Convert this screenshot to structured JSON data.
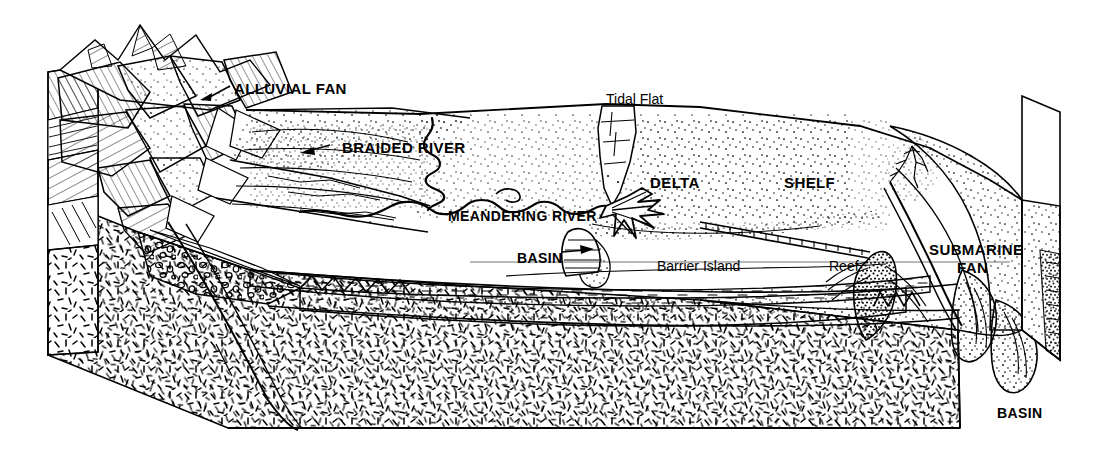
{
  "figure": {
    "type": "geological-block-diagram",
    "background_color": "#ffffff",
    "ink_color": "#000000",
    "width": 1102,
    "height": 452
  },
  "labels": [
    {
      "id": "alluvial-fan",
      "text": "ALLUVIAL FAN",
      "case": "upper",
      "x": 234,
      "y": 80,
      "size": 15,
      "arrow": true,
      "arrow_dir": "down-left"
    },
    {
      "id": "braided-river",
      "text": "BRAIDED RIVER",
      "case": "upper",
      "x": 332,
      "y": 139,
      "size": 15,
      "arrow": true,
      "arrow_dir": "left"
    },
    {
      "id": "tidal-flat",
      "text": "Tidal Flat",
      "case": "mixed",
      "x": 606,
      "y": 91,
      "size": 14,
      "arrow": false,
      "arrow_dir": ""
    },
    {
      "id": "meandering-river",
      "text": "MEANDERING RIVER",
      "case": "upper",
      "x": 448,
      "y": 208,
      "size": 14,
      "arrow": false,
      "arrow_dir": ""
    },
    {
      "id": "delta",
      "text": "DELTA",
      "case": "upper",
      "x": 650,
      "y": 174,
      "size": 15,
      "arrow": false,
      "arrow_dir": ""
    },
    {
      "id": "shelf",
      "text": "SHELF",
      "case": "upper",
      "x": 784,
      "y": 174,
      "size": 15,
      "arrow": false,
      "arrow_dir": ""
    },
    {
      "id": "basin-left",
      "text": "BASIN",
      "case": "upper",
      "x": 517,
      "y": 250,
      "size": 14,
      "arrow": true,
      "arrow_dir": "right"
    },
    {
      "id": "barrier-island",
      "text": "Barrier Island",
      "case": "mixed",
      "x": 657,
      "y": 258,
      "size": 14,
      "arrow": false,
      "arrow_dir": ""
    },
    {
      "id": "reef",
      "text": "Reef",
      "case": "mixed",
      "x": 829,
      "y": 258,
      "size": 14,
      "arrow": false,
      "arrow_dir": ""
    },
    {
      "id": "submarine-fan-1",
      "text": "SUBMARINE",
      "case": "upper",
      "x": 929,
      "y": 241,
      "size": 15,
      "arrow": false,
      "arrow_dir": ""
    },
    {
      "id": "submarine-fan-2",
      "text": "FAN",
      "case": "upper",
      "x": 957,
      "y": 259,
      "size": 15,
      "arrow": false,
      "arrow_dir": ""
    },
    {
      "id": "basin-right",
      "text": "BASIN",
      "case": "upper",
      "x": 997,
      "y": 405,
      "size": 14,
      "arrow": false,
      "arrow_dir": ""
    }
  ],
  "environments": [
    "ALLUVIAL FAN",
    "BRAIDED RIVER",
    "MEANDERING RIVER",
    "Tidal Flat",
    "DELTA",
    "SHELF",
    "Barrier Island",
    "Reef",
    "BASIN",
    "SUBMARINE FAN"
  ],
  "facies": [
    {
      "name": "basement",
      "pattern": "random-dash-hatch"
    },
    {
      "name": "conglomerate",
      "pattern": "pebble-circles"
    },
    {
      "name": "sandstone",
      "pattern": "fine-stipple"
    },
    {
      "name": "shale",
      "pattern": "horizontal-dashes"
    },
    {
      "name": "reef-carbonate",
      "pattern": "dense-stipple"
    }
  ]
}
